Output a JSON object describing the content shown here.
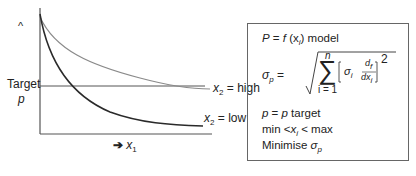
{
  "diagram": {
    "y_axis_marker": "^",
    "target_label": "Target",
    "target_symbol": "p",
    "x_axis_arrow": "➔",
    "x_axis_var": "x",
    "x_axis_sub": "1",
    "curves": [
      {
        "name": "x2 = high",
        "label_var": "x",
        "label_sub": "2",
        "label_text": " = high",
        "color": "#8a8a8a"
      },
      {
        "name": "x2 = low",
        "label_var": "x",
        "label_sub": "2",
        "label_text": " = low",
        "color": "#2a2a2a"
      }
    ]
  },
  "model_box": {
    "line1": {
      "P": "P",
      "eq": " = ",
      "f": "f",
      "arg": "(x",
      "arg_sub": "i",
      "close": ")",
      "rest": " model"
    },
    "sigma_p": "σ",
    "sigma_sub": "p",
    "equals": " =",
    "sum_upper": "n",
    "sum_lower": "i = 1",
    "sum_symbol": "∑",
    "inner_sigma": "σ",
    "inner_sigma_sub": "i",
    "deriv_num": "d",
    "deriv_num_sub": "f",
    "deriv_den": "dx",
    "deriv_den_sub": "i",
    "exponent": "2",
    "constraint1": {
      "a": "p",
      "b": " = ",
      "c": "p",
      "d": " target"
    },
    "constraint2": {
      "a": "min <",
      "b": "x",
      "sub": "i",
      "c": " < max"
    },
    "constraint3": {
      "a": "Minimise ",
      "b": "σ",
      "sub": "p"
    }
  }
}
